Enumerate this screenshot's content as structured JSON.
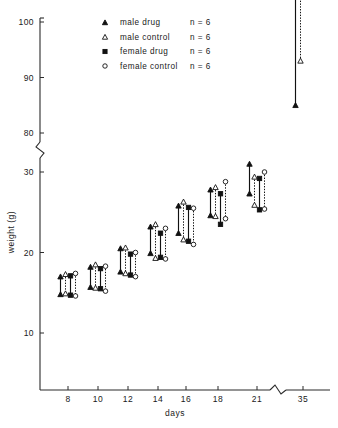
{
  "figure": {
    "background": "#ffffff",
    "ink": "#111111"
  },
  "chart_data": {
    "type": "scatter",
    "title": "",
    "xlabel": "days",
    "ylabel": "weight (g)",
    "x": [
      8,
      10,
      12,
      14,
      16,
      18,
      21,
      35
    ],
    "xtick_labels": [
      "8",
      "10",
      "12",
      "14",
      "16",
      "18",
      "21",
      "35"
    ],
    "ytick_labels": [
      "10",
      "20",
      "30",
      "80",
      "90",
      "100"
    ],
    "ytick_values": [
      10,
      20,
      30,
      80,
      90,
      100
    ],
    "ylim": [
      6,
      100
    ],
    "y_axis_break": {
      "present": true,
      "between": [
        30,
        80
      ]
    },
    "x_axis_break": {
      "present": true,
      "between": [
        21,
        35
      ]
    },
    "grid": false,
    "legend_position": "upper-center",
    "legend_sample_note": "n = 6",
    "series": [
      {
        "name": "male drug",
        "marker": "filled-triangle",
        "line": "solid",
        "n": 6,
        "upper": [
          17.0,
          18.2,
          20.5,
          23.2,
          25.8,
          27.8,
          31.0,
          85.0
        ],
        "lower": [
          14.8,
          15.7,
          17.6,
          19.9,
          22.4,
          24.6,
          27.3,
          78.0
        ]
      },
      {
        "name": "male control",
        "marker": "open-triangle",
        "line": "dashed",
        "n": 6,
        "upper": [
          17.3,
          18.5,
          20.6,
          23.5,
          26.3,
          28.1,
          29.4,
          93.0
        ],
        "lower": [
          14.9,
          15.6,
          17.4,
          19.3,
          21.6,
          24.5,
          25.9,
          79.2
        ]
      },
      {
        "name": "female drug",
        "marker": "filled-square",
        "line": "solid",
        "n": 6,
        "upper": [
          17.1,
          18.0,
          19.8,
          22.4,
          25.6,
          27.3,
          29.2,
          77.5
        ],
        "lower": [
          14.7,
          15.5,
          17.2,
          19.4,
          21.4,
          23.5,
          25.3,
          73.0
        ]
      },
      {
        "name": "female control",
        "marker": "open-circle",
        "line": "dashed",
        "n": 6,
        "upper": [
          17.4,
          18.3,
          20.0,
          23.0,
          25.5,
          28.8,
          30.0,
          78.6
        ],
        "lower": [
          14.6,
          15.2,
          17.0,
          19.2,
          21.0,
          24.2,
          25.4,
          72.8
        ]
      }
    ]
  },
  "legend": {
    "items": [
      {
        "label": "male drug",
        "count": "n = 6",
        "marker": "filled-triangle"
      },
      {
        "label": "male control",
        "count": "n = 6",
        "marker": "open-triangle"
      },
      {
        "label": "female drug",
        "count": "n = 6",
        "marker": "filled-square"
      },
      {
        "label": "female control",
        "count": "n = 6",
        "marker": "open-circle"
      }
    ]
  },
  "axes": {
    "x_title": "days",
    "y_title": "weight (g)"
  }
}
